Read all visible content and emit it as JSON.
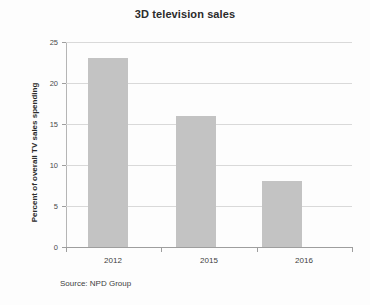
{
  "chart_data": {
    "type": "bar",
    "title": "3D television sales",
    "xlabel": "",
    "ylabel": "Percent of overall TV sales spending",
    "categories": [
      "2012",
      "2015",
      "2016"
    ],
    "values": [
      23,
      16,
      8
    ],
    "ylim": [
      0,
      25
    ],
    "yticks": [
      0,
      5,
      10,
      15,
      20,
      25
    ],
    "ytick_labels": [
      "0",
      "5",
      "10",
      "15",
      "20",
      "25"
    ],
    "grid": "horizontal",
    "legend": "none",
    "annotations": [
      "Source: NPD Group"
    ],
    "series": [
      {
        "name": "Percent of overall TV sales spending",
        "values": [
          23,
          16,
          8
        ],
        "color": "#c3c3c3"
      }
    ]
  },
  "footer": {
    "source_label": "Source: NPD Group"
  },
  "colors": {
    "bar": "#c3c3c3",
    "gridline": "#d9d9d9",
    "axis": "#9e9e9e",
    "text": "#333333",
    "background": "#fdfdfd"
  }
}
